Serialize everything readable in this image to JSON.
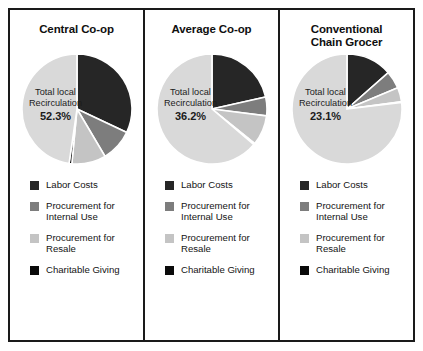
{
  "chart_data": [
    {
      "type": "pie",
      "title": "Central Co-op",
      "categories": [
        "Labor Costs",
        "Procurement for Internal Use",
        "Procurement for Resale",
        "Charitable Giving"
      ],
      "values": [
        32.0,
        9.5,
        10.0,
        0.8
      ],
      "other_value": 47.7,
      "center_label": "Total local\nRecirculation",
      "center_value": "52.3%",
      "legend_position": "bottom",
      "colors": [
        "#262626",
        "#7d7d7d",
        "#c4c4c4",
        "#0a0a0a"
      ],
      "remainder_color": "#d9d9d9"
    },
    {
      "type": "pie",
      "title": "Average Co-op",
      "categories": [
        "Labor Costs",
        "Procurement for Internal Use",
        "Procurement for Resale",
        "Charitable Giving"
      ],
      "values": [
        21.5,
        5.5,
        8.8,
        0.4
      ],
      "other_value": 63.8,
      "center_label": "Total local\nRecirculation",
      "center_value": "36.2%",
      "legend_position": "bottom",
      "colors": [
        "#262626",
        "#7d7d7d",
        "#c4c4c4",
        "#0a0a0a"
      ],
      "remainder_color": "#d9d9d9"
    },
    {
      "type": "pie",
      "title": "Conventional\nChain Grocer",
      "categories": [
        "Labor Costs",
        "Procurement for Internal Use",
        "Procurement for Resale",
        "Charitable Giving"
      ],
      "values": [
        13.5,
        5.2,
        4.2,
        0.2
      ],
      "other_value": 76.9,
      "center_label": "Total local\nRecirculation",
      "center_value": "23.1%",
      "legend_position": "bottom",
      "colors": [
        "#262626",
        "#7d7d7d",
        "#c4c4c4",
        "#0a0a0a"
      ],
      "remainder_color": "#d9d9d9"
    }
  ],
  "panels": [
    {
      "title": "Central Co-op",
      "center_label": "Total local\nRecirculation",
      "center_value": "52.3%"
    },
    {
      "title": "Average Co-op",
      "center_label": "Total local\nRecirculation",
      "center_value": "36.2%"
    },
    {
      "title": "Conventional\nChain Grocer",
      "center_label": "Total local\nRecirculation",
      "center_value": "23.1%"
    }
  ],
  "legend": {
    "items": [
      {
        "label": "Labor Costs",
        "color": "#262626"
      },
      {
        "label": "Procurement for\nInternal Use",
        "color": "#7d7d7d"
      },
      {
        "label": "Procurement for\nResale",
        "color": "#c4c4c4"
      },
      {
        "label": "Charitable Giving",
        "color": "#0a0a0a"
      }
    ]
  }
}
